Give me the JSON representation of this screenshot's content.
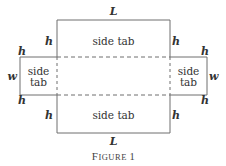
{
  "figure": {
    "caption_first": "F",
    "caption_rest": "IGURE",
    "caption_number": "1",
    "caption": "Figure 1"
  },
  "dimensions": {
    "length": "L",
    "height": "h",
    "width": "w"
  },
  "tabs": {
    "top": "side tab",
    "bottom": "side tab",
    "left_line1": "side",
    "left_line2": "tab",
    "right_line1": "side",
    "right_line2": "tab"
  },
  "colors": {
    "line": "#6e6e6e",
    "text": "#333333"
  }
}
